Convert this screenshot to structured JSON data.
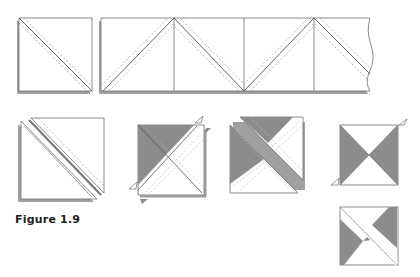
{
  "figure": {
    "caption": "Figure 1.9"
  },
  "colors": {
    "line": "#6e6e6e",
    "seam": "#9a9a9a",
    "shade": "#8c8c8c",
    "shadow": "#9c9c9c",
    "background": "#ffffff"
  },
  "diagram": {
    "top_row": [
      {
        "id": "single-square-diagonal",
        "description": "Two stacked squares with one diagonal stitched seam"
      },
      {
        "id": "zigzag-strip",
        "description": "Strip of squares stitched along alternating diagonals with a torn right edge",
        "segments": 4
      }
    ],
    "second_row": [
      {
        "id": "cut-square-pair",
        "description": "Square cut apart along the diagonal between seams"
      },
      {
        "id": "pressed-square",
        "description": "Half-square triangle unit with a shaded triangle and dog-ear notches"
      },
      {
        "id": "separated-square",
        "description": "Quarter-square unit cut across the opposite diagonal"
      },
      {
        "id": "hourglass-block",
        "description": "Hourglass block with shaded left and right triangles"
      },
      {
        "id": "pinwheel-block",
        "description": "Offset pinwheel arrangement of shaded triangles"
      }
    ]
  }
}
